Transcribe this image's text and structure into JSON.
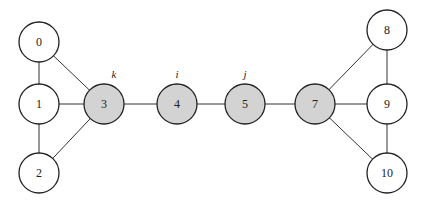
{
  "colors": {
    "plain_fill": "#ffffff",
    "highlight_fill": "#d3d3d3",
    "stroke": "#222222"
  },
  "radius": 20,
  "nodes": [
    {
      "id": "0",
      "label": "0",
      "x": 39,
      "y": 42,
      "highlight": false
    },
    {
      "id": "1",
      "label": "1",
      "x": 39,
      "y": 104,
      "highlight": false
    },
    {
      "id": "2",
      "label": "2",
      "x": 39,
      "y": 173,
      "highlight": false
    },
    {
      "id": "3",
      "label": "3",
      "x": 104,
      "y": 104,
      "highlight": true,
      "annotation": "k"
    },
    {
      "id": "4",
      "label": "4",
      "x": 177,
      "y": 104,
      "highlight": true,
      "annotation": "i"
    },
    {
      "id": "5",
      "label": "5",
      "x": 245,
      "y": 104,
      "highlight": true,
      "annotation": "j"
    },
    {
      "id": "7",
      "label": "7",
      "x": 315,
      "y": 104,
      "highlight": true
    },
    {
      "id": "8",
      "label": "8",
      "x": 387,
      "y": 30,
      "highlight": false
    },
    {
      "id": "9",
      "label": "9",
      "x": 387,
      "y": 104,
      "highlight": false
    },
    {
      "id": "10",
      "label": "10",
      "x": 387,
      "y": 173,
      "highlight": false
    }
  ],
  "edges": [
    [
      "0",
      "1"
    ],
    [
      "1",
      "2"
    ],
    [
      "0",
      "3"
    ],
    [
      "1",
      "3"
    ],
    [
      "2",
      "3"
    ],
    [
      "3",
      "4"
    ],
    [
      "4",
      "5"
    ],
    [
      "5",
      "7"
    ],
    [
      "7",
      "8"
    ],
    [
      "7",
      "9"
    ],
    [
      "7",
      "10"
    ],
    [
      "8",
      "9"
    ],
    [
      "9",
      "10"
    ]
  ]
}
